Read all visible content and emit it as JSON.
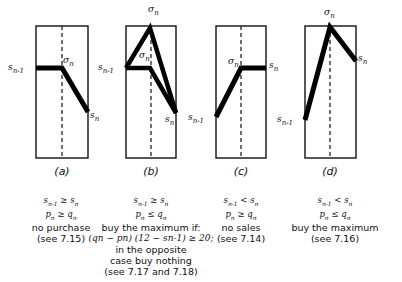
{
  "panels": [
    {
      "id": "a",
      "label": "(a)",
      "box": {
        "x": 36,
        "y": 26,
        "w": 52,
        "h": 132
      },
      "curve": [
        [
          36,
          68
        ],
        [
          62,
          68
        ],
        [
          88,
          112
        ]
      ],
      "point_labels": {
        "start": "sn-1",
        "mid": "σn",
        "end": "sn"
      },
      "conditions": [
        "sn-1 ≥ sn",
        "pn ≥ qn"
      ],
      "description": [
        "no purchase",
        "(see 7.15)"
      ]
    },
    {
      "id": "b",
      "label": "(b)",
      "box": {
        "x": 126,
        "y": 26,
        "w": 50,
        "h": 132
      },
      "curves": [
        [
          [
            126,
            68
          ],
          [
            150,
            28
          ],
          [
            176,
            113
          ]
        ],
        [
          [
            126,
            68
          ],
          [
            150,
            68
          ],
          [
            176,
            113
          ]
        ]
      ],
      "point_labels": {
        "start": "sn-1",
        "top": "σn",
        "mid": "σn",
        "end": "sn"
      },
      "conditions": [
        "sn-1 ≥ sn",
        "pn ≤ qn"
      ],
      "description": [
        "buy the maximum if:",
        "(qn − pn) (12 − sn-1) ≥ 20;",
        "in the opposite",
        "case buy nothing",
        "(see 7.17 and 7.18)"
      ]
    },
    {
      "id": "c",
      "label": "(c)",
      "box": {
        "x": 216,
        "y": 26,
        "w": 50,
        "h": 132
      },
      "curve": [
        [
          216,
          117
        ],
        [
          241,
          68
        ],
        [
          266,
          68
        ]
      ],
      "point_labels": {
        "start": "sn-1",
        "mid": "σn",
        "end": "sn"
      },
      "conditions": [
        "sn-1 < sn",
        "pn ≥ qn"
      ],
      "description": [
        "no sales",
        "(see 7.14)"
      ]
    },
    {
      "id": "d",
      "label": "(d)",
      "box": {
        "x": 305,
        "y": 26,
        "w": 51,
        "h": 132
      },
      "curve": [
        [
          305,
          120
        ],
        [
          330,
          27
        ],
        [
          356,
          61
        ]
      ],
      "point_labels": {
        "start": "sn-1",
        "top": "σn",
        "end": "sn"
      },
      "conditions": [
        "sn-1 < sn",
        "pn ≤ qn"
      ],
      "description": [
        "buy the maximum",
        "(see 7.16)"
      ]
    }
  ],
  "captions": {
    "a": {
      "c1": "s",
      "c1sub": "n-1",
      "c1rel": " ≥ s",
      "c1sub2": "n",
      "c2": "p",
      "c2sub": "n",
      "c2rel": " ≥ q",
      "c2sub2": "n",
      "d1": "no purchase",
      "d2": "(see 7.15)"
    },
    "b": {
      "c1": "s",
      "c1sub": "n-1",
      "c1rel": " ≥ s",
      "c1sub2": "n",
      "c2": "p",
      "c2sub": "n",
      "c2rel": " ≤ q",
      "c2sub2": "n",
      "d1": "buy the maximum if:",
      "d2": "(qn − pn) (12 − sn-1) ≥ 20;",
      "d3": "in the opposite",
      "d4": "case buy nothing",
      "d5": "(see 7.17 and 7.18)"
    },
    "c": {
      "c1": "s",
      "c1sub": "n-1",
      "c1rel": " < s",
      "c1sub2": "n",
      "c2": "p",
      "c2sub": "n",
      "c2rel": " ≥ q",
      "c2sub2": "n",
      "d1": "no sales",
      "d2": "(see 7.14)"
    },
    "d": {
      "c1": "s",
      "c1sub": "n-1",
      "c1rel": " < s",
      "c1sub2": "n",
      "c2": "p",
      "c2sub": "n",
      "c2rel": " ≤ q",
      "c2sub2": "n",
      "d1": "buy the maximum",
      "d2": "(see 7.16)"
    }
  },
  "labels": {
    "a": "(a)",
    "b": "(b)",
    "c": "(c)",
    "d": "(d)",
    "s": "s",
    "sigma": "σ",
    "sub_n": "n",
    "sub_n1": "n-1"
  }
}
